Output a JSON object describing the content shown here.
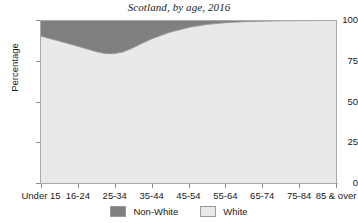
{
  "chart_data": {
    "type": "area",
    "title": "Scotland, by age, 2016",
    "xlabel": "",
    "ylabel": "Percentage",
    "categories": [
      "Under 15",
      "16-24",
      "25-34",
      "35-44",
      "45-54",
      "55-64",
      "65-74",
      "75-84",
      "85 & over"
    ],
    "ylim": [
      0,
      100
    ],
    "yticks": [
      0,
      25,
      50,
      75,
      100
    ],
    "ytick_labels": [
      "0",
      "25",
      "50",
      "75",
      "100"
    ],
    "grid": false,
    "stacked": true,
    "legend_position": "bottom",
    "series": [
      {
        "name": "White",
        "color": "#e9e9e9",
        "values": [
          90.0,
          84.0,
          77.0,
          89.0,
          96.0,
          98.5,
          99.3,
          99.6,
          99.7
        ]
      },
      {
        "name": "Non-White",
        "color": "#808080",
        "values": [
          10.0,
          16.0,
          23.0,
          11.0,
          4.0,
          1.5,
          0.7,
          0.4,
          0.3
        ]
      }
    ]
  },
  "legend": {
    "items": [
      {
        "label": "Non-White",
        "color": "#808080"
      },
      {
        "label": "White",
        "color": "#e9e9e9"
      }
    ]
  },
  "colors": {
    "non_white": "#808080",
    "white": "#e9e9e9",
    "axis": "#a9a9a9",
    "text": "#1a1a1a",
    "background": "#ffffff"
  }
}
